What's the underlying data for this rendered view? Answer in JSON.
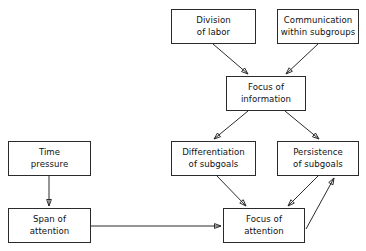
{
  "diagram": {
    "background_color": "#ffffff",
    "line_color": "#2b2b2b",
    "text_color": "#111111",
    "nodes": [
      {
        "id": "division_of_labor",
        "label": "Division\nof labor",
        "x": 171,
        "y": 9,
        "w": 85,
        "h": 35
      },
      {
        "id": "communication_subgroups",
        "label": "Communication\nwithin subgroups",
        "x": 277,
        "y": 9,
        "w": 82,
        "h": 35
      },
      {
        "id": "focus_of_information",
        "label": "Focus of\ninformation",
        "x": 226,
        "y": 76,
        "w": 80,
        "h": 35
      },
      {
        "id": "time_pressure",
        "label": "Time\npressure",
        "x": 8,
        "y": 141,
        "w": 83,
        "h": 35
      },
      {
        "id": "differentiation_subgoals",
        "label": "Differentiation\nof subgoals",
        "x": 171,
        "y": 141,
        "w": 85,
        "h": 35
      },
      {
        "id": "persistence_subgoals",
        "label": "Persistence\nof subgoals",
        "x": 277,
        "y": 141,
        "w": 82,
        "h": 35
      },
      {
        "id": "span_of_attention",
        "label": "Span of\nattention",
        "x": 8,
        "y": 208,
        "w": 83,
        "h": 35
      },
      {
        "id": "focus_of_attention",
        "label": "Focus of\nattention",
        "x": 223,
        "y": 208,
        "w": 82,
        "h": 35
      }
    ],
    "edges": [
      {
        "id": "e1",
        "from": "division_of_labor",
        "to": "focus_of_information",
        "x1": 213,
        "y1": 44,
        "x2": 248,
        "y2": 74,
        "arrow": true
      },
      {
        "id": "e2",
        "from": "communication_subgroups",
        "to": "focus_of_information",
        "x1": 318,
        "y1": 44,
        "x2": 286,
        "y2": 74,
        "arrow": true
      },
      {
        "id": "e3",
        "from": "focus_of_information",
        "to": "differentiation_subgoals",
        "x1": 248,
        "y1": 111,
        "x2": 214,
        "y2": 139,
        "arrow": true
      },
      {
        "id": "e4",
        "from": "focus_of_information",
        "to": "persistence_subgoals",
        "x1": 285,
        "y1": 111,
        "x2": 319,
        "y2": 139,
        "arrow": true
      },
      {
        "id": "e5",
        "from": "time_pressure",
        "to": "span_of_attention",
        "x1": 49,
        "y1": 176,
        "x2": 49,
        "y2": 206,
        "arrow": true
      },
      {
        "id": "e6",
        "from": "span_of_attention",
        "to": "focus_of_attention",
        "x1": 91,
        "y1": 226,
        "x2": 221,
        "y2": 226,
        "arrow": true
      },
      {
        "id": "e7",
        "from": "differentiation_subgoals",
        "to": "focus_of_attention",
        "x1": 217,
        "y1": 176,
        "x2": 246,
        "y2": 206,
        "arrow": true
      },
      {
        "id": "e8",
        "from": "persistence_subgoals",
        "to": "focus_of_attention",
        "x1": 318,
        "y1": 176,
        "x2": 288,
        "y2": 206,
        "arrow": true
      },
      {
        "id": "e9",
        "from": "focus_of_attention",
        "to": "persistence_subgoals",
        "x1": 306,
        "y1": 229,
        "x2": 334,
        "y2": 178,
        "arrow": true
      }
    ]
  }
}
